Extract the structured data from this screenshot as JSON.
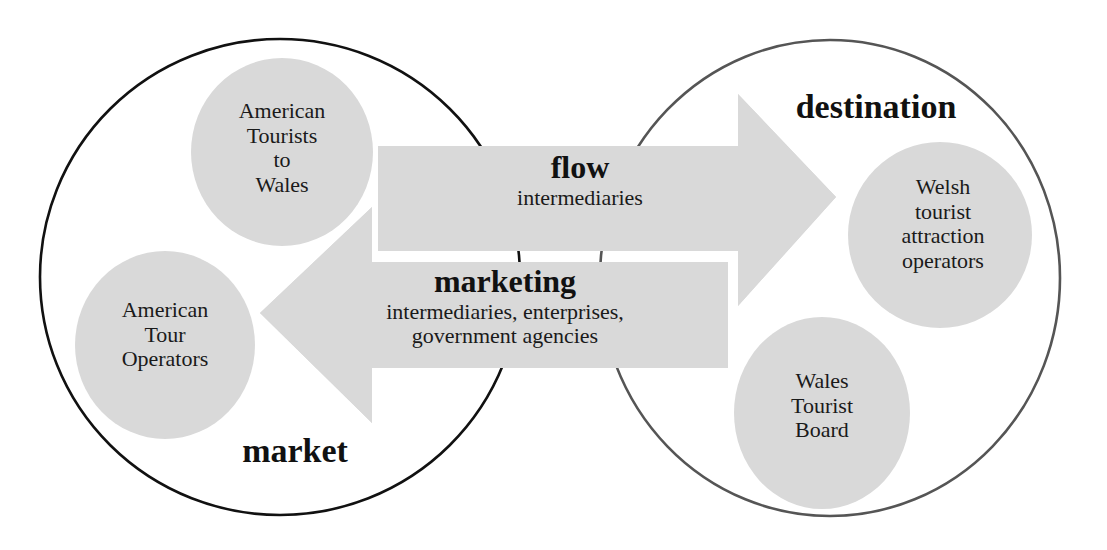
{
  "diagram": {
    "regions": {
      "market": {
        "label": "market",
        "stroke": "#111111"
      },
      "destination": {
        "label": "destination",
        "stroke": "#555555"
      }
    },
    "nodes": {
      "american_tourists": {
        "lines": [
          "American",
          "Tourists",
          "to",
          "Wales"
        ]
      },
      "american_tour_operators": {
        "lines": [
          "American",
          "Tour",
          "Operators"
        ]
      },
      "welsh_attraction_operators": {
        "lines": [
          "Welsh",
          "tourist",
          "attraction",
          "operators"
        ]
      },
      "wales_tourist_board": {
        "lines": [
          "Wales",
          "Tourist",
          "Board"
        ]
      }
    },
    "arrows": {
      "flow": {
        "direction": "market-to-destination",
        "title": "flow",
        "subtitle_lines": [
          "intermediaries"
        ]
      },
      "marketing": {
        "direction": "destination-to-market",
        "title": "marketing",
        "subtitle_lines": [
          "intermediaries, enterprises,",
          "government agencies"
        ]
      }
    },
    "colors": {
      "fill_grey": "#d9d9d9",
      "background": "#ffffff",
      "text": "#111111"
    }
  }
}
